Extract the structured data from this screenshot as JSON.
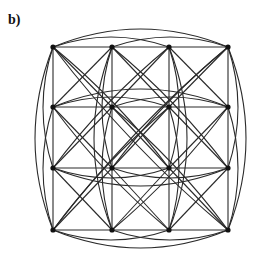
{
  "figure": {
    "panel_label": "b)",
    "type": "graph",
    "colors": {
      "edge": "#2a2a2a",
      "node": "#111111",
      "background": "#ffffff"
    },
    "grid": {
      "cols_x": [
        53,
        112,
        169,
        228
      ],
      "rows_y": [
        47,
        107,
        168,
        230
      ]
    },
    "node_radius": 2.6
  }
}
